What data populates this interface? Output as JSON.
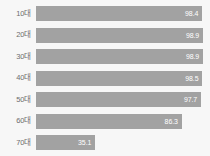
{
  "chart_data": {
    "type": "bar",
    "orientation": "horizontal",
    "title": "",
    "xlabel": "",
    "ylabel": "",
    "xlim": [
      0,
      100
    ],
    "grid": false,
    "legend": null,
    "bar_color": "#a2a2a2",
    "background_color": "#f7f7f7",
    "label_color": "#6e6e6e",
    "value_label_color": "#ffffff",
    "categories": [
      "10대",
      "20대",
      "30대",
      "40대",
      "50대",
      "60대",
      "70대"
    ],
    "values": [
      98.4,
      98.9,
      98.9,
      98.5,
      97.7,
      86.3,
      35.1
    ],
    "value_labels": [
      "98.4",
      "98.9",
      "98.9",
      "98.5",
      "97.7",
      "86.3",
      "35.1"
    ],
    "rows": [
      {
        "category": "10대",
        "value": 98.4,
        "value_label": "98.4"
      },
      {
        "category": "20대",
        "value": 98.9,
        "value_label": "98.9"
      },
      {
        "category": "30대",
        "value": 98.9,
        "value_label": "98.9"
      },
      {
        "category": "40대",
        "value": 98.5,
        "value_label": "98.5"
      },
      {
        "category": "50대",
        "value": 97.7,
        "value_label": "97.7"
      },
      {
        "category": "60대",
        "value": 86.3,
        "value_label": "86.3"
      },
      {
        "category": "70대",
        "value": 35.1,
        "value_label": "35.1"
      }
    ]
  }
}
